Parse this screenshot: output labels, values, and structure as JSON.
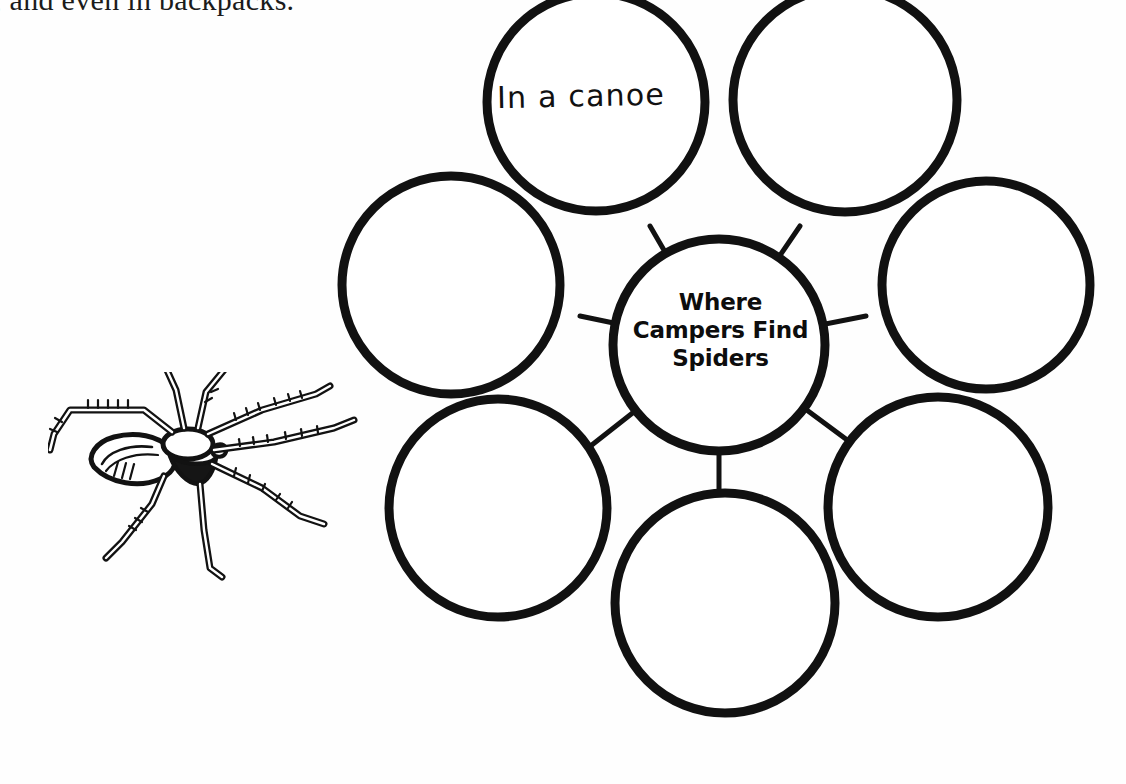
{
  "page": {
    "kind": "worksheet-scan",
    "background_color": "#fefefe",
    "ink_color": "#111111"
  },
  "body_text": {
    "line": ", and even in backpacks."
  },
  "illustration": {
    "name": "spider-line-art",
    "caption": ""
  },
  "organizer": {
    "type": "web-cluster-graphic-organizer",
    "center": {
      "label": "Where\nCampers Find\nSpiders",
      "line1": "Where",
      "line2": "Campers Find",
      "line3": "Spiders"
    },
    "satellites": [
      {
        "id": "top-left",
        "answer": "In a canoe",
        "filled": true,
        "handwritten": true
      },
      {
        "id": "top-right",
        "answer": "",
        "filled": false,
        "handwritten": false
      },
      {
        "id": "left",
        "answer": "",
        "filled": false,
        "handwritten": false
      },
      {
        "id": "right",
        "answer": "",
        "filled": false,
        "handwritten": false
      },
      {
        "id": "bottom-left",
        "answer": "",
        "filled": false,
        "handwritten": false
      },
      {
        "id": "bottom-right",
        "answer": "",
        "filled": false,
        "handwritten": false
      },
      {
        "id": "bottom",
        "answer": "",
        "filled": false,
        "handwritten": false
      }
    ],
    "satellite_count": 6,
    "answers_written": 1
  }
}
